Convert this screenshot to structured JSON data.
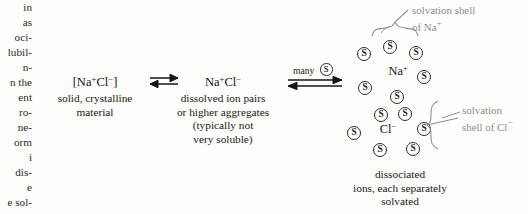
{
  "left_column": {
    "name": "cut-off-body-text-column",
    "lines": [
      "in",
      "as",
      "oci-",
      "lubil-",
      "n-",
      "n the",
      "ent",
      "ro-",
      "ne-",
      "orm",
      "i",
      "dis-",
      "e",
      "e sol-"
    ]
  },
  "stage1": {
    "formula_html": "[Na<sup>+</sup>Cl<sup>&#8722;</sup>]",
    "formula_text": "[Na+Cl-]",
    "caption_lines": [
      "solid, crystalline",
      "material"
    ]
  },
  "arrow1": {
    "symbol": "equilibrium-double-arrow",
    "label": ""
  },
  "stage2": {
    "formula_html": "Na<sup>+</sup>Cl<sup>&#8722;</sup>",
    "formula_text": "Na+Cl-",
    "caption_lines": [
      "dissolved ion pairs",
      "or higher aggregates",
      "(typically not",
      "very soluble)"
    ]
  },
  "arrow2": {
    "symbol": "equilibrium-double-arrow",
    "label": "many",
    "solvent_glyph": "S"
  },
  "stage3": {
    "ion_cation_html": "Na<sup>+</sup>",
    "ion_cation_text": "Na+",
    "ion_anion_html": "Cl<sup>&#8722;</sup>",
    "ion_anion_text": "Cl-",
    "caption_lines": [
      "dissociated",
      "ions, each separately",
      "solvated"
    ],
    "solvent_glyph": "S",
    "solvent_count": 14
  },
  "annotations": {
    "na_shell_lines": [
      "solvation shell",
      "of Na<sup>+</sup>"
    ],
    "na_shell_text": "solvation shell of Na+",
    "cl_shell_lines": [
      "solvation",
      "shell of Cl<sup>&#8722;</sup>"
    ],
    "cl_shell_text": "solvation shell of Cl-"
  },
  "colors": {
    "ink": "#191919",
    "annotation_gray": "#8d8d8d",
    "paper": "#fdfdfb"
  }
}
